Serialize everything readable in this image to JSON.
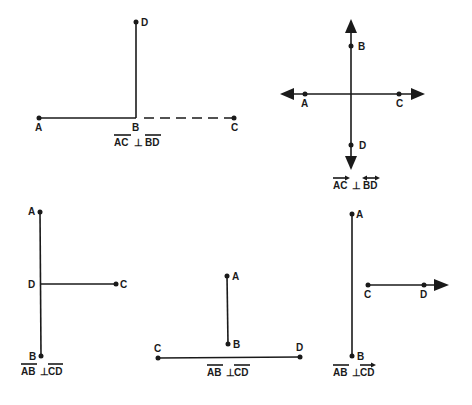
{
  "figures": [
    {
      "id": "fig1",
      "points": {
        "A": "A",
        "B": "B",
        "C": "C",
        "D": "D"
      },
      "caption": {
        "left": "AC",
        "symbol": "⊥",
        "right": "BD",
        "left_mark": "segment",
        "right_mark": "segment"
      }
    },
    {
      "id": "fig2",
      "points": {
        "A": "A",
        "B": "B",
        "C": "C",
        "D": "D"
      },
      "caption": {
        "left": "AC",
        "symbol": "⊥",
        "right": "BD",
        "left_mark": "ray",
        "right_mark": "line"
      }
    },
    {
      "id": "fig3",
      "points": {
        "A": "A",
        "B": "B",
        "C": "C",
        "D": "D"
      },
      "caption": {
        "left": "AB",
        "symbol": "⊥",
        "right": "CD",
        "left_mark": "segment",
        "right_mark": "segment"
      }
    },
    {
      "id": "fig4",
      "points": {
        "A": "A",
        "B": "B",
        "C": "C",
        "D": "D"
      },
      "caption": {
        "left": "AB",
        "symbol": "⊥",
        "right": "CD",
        "left_mark": "segment",
        "right_mark": "segment"
      }
    },
    {
      "id": "fig5",
      "points": {
        "A": "A",
        "B": "B",
        "C": "C",
        "D": "D"
      },
      "caption": {
        "left": "AB",
        "symbol": "⊥",
        "right": "CD",
        "left_mark": "segment",
        "right_mark": "ray"
      }
    }
  ]
}
